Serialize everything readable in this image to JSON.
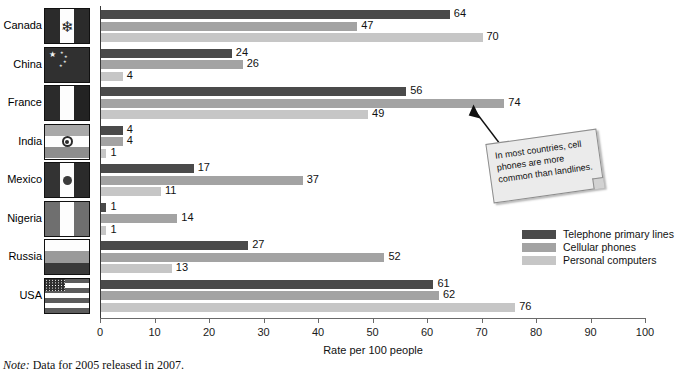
{
  "chart_data": {
    "type": "bar",
    "orientation": "horizontal",
    "title": "",
    "xlabel": "Rate per 100 people",
    "ylabel": "",
    "xlim": [
      0,
      100
    ],
    "xticks": [
      0,
      10,
      20,
      30,
      40,
      50,
      60,
      70,
      80,
      90,
      100
    ],
    "grid": false,
    "legend_position": "right",
    "categories": [
      "Canada",
      "China",
      "France",
      "India",
      "Mexico",
      "Nigeria",
      "Russia",
      "USA"
    ],
    "series": [
      {
        "name": "Telephone primary lines",
        "color": "#4a4a4a",
        "values": [
          64,
          24,
          56,
          4,
          17,
          1,
          27,
          61
        ]
      },
      {
        "name": "Cellular phones",
        "color": "#a3a3a3",
        "values": [
          47,
          26,
          74,
          4,
          37,
          14,
          52,
          62
        ]
      },
      {
        "name": "Personal computers",
        "color": "#c6c6c6",
        "values": [
          70,
          4,
          49,
          1,
          11,
          1,
          13,
          76
        ]
      }
    ],
    "annotations": [
      {
        "text": "In most countries, cell phones are more common than landlines.",
        "points_to": "France / Cellular phones (74)"
      }
    ],
    "note": "Note: Data for 2005 released in 2007."
  },
  "axis": {
    "x_title": "Rate per 100 people",
    "tick_labels": [
      "0",
      "10",
      "20",
      "30",
      "40",
      "50",
      "60",
      "70",
      "80",
      "90",
      "100"
    ]
  },
  "rows": [
    {
      "label": "Canada",
      "flag": "canada-flag",
      "values": [
        "64",
        "47",
        "70"
      ]
    },
    {
      "label": "China",
      "flag": "china-flag",
      "values": [
        "24",
        "26",
        "4"
      ]
    },
    {
      "label": "France",
      "flag": "france-flag",
      "values": [
        "56",
        "74",
        "49"
      ]
    },
    {
      "label": "India",
      "flag": "india-flag",
      "values": [
        "4",
        "4",
        "1"
      ]
    },
    {
      "label": "Mexico",
      "flag": "mexico-flag",
      "values": [
        "17",
        "37",
        "11"
      ]
    },
    {
      "label": "Nigeria",
      "flag": "nigeria-flag",
      "values": [
        "1",
        "14",
        "1"
      ]
    },
    {
      "label": "Russia",
      "flag": "russia-flag",
      "values": [
        "27",
        "52",
        "13"
      ]
    },
    {
      "label": "USA",
      "flag": "usa-flag",
      "values": [
        "61",
        "62",
        "76"
      ]
    }
  ],
  "legend": {
    "items": [
      {
        "label": "Telephone primary lines",
        "color": "#4a4a4a"
      },
      {
        "label": "Cellular phones",
        "color": "#a3a3a3"
      },
      {
        "label": "Personal computers",
        "color": "#c6c6c6"
      }
    ]
  },
  "callout": {
    "text": "In most countries, cell phones are more common than landlines."
  },
  "note": {
    "prefix": "Note:",
    "text": "Data for 2005 released in 2007."
  }
}
